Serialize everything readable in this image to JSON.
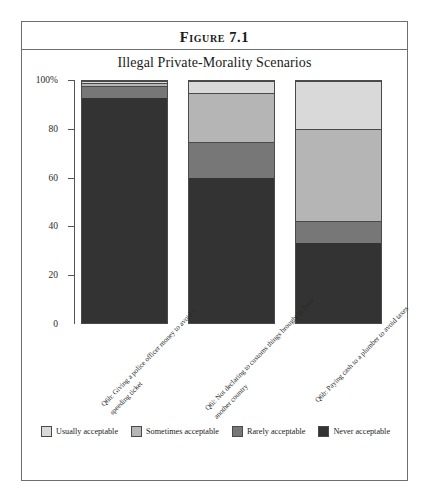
{
  "figure": {
    "title": "Figure 7.1",
    "subtitle": "Illegal Private-Morality Scenarios"
  },
  "chart_data": {
    "type": "bar",
    "subtype": "stacked-percentage-column",
    "title": "Illegal Private-Morality Scenarios",
    "figure_label": "Figure 7.1",
    "xlabel": "",
    "ylabel": "",
    "ylim": [
      0,
      100
    ],
    "ytick_labels": [
      "0",
      "20",
      "40",
      "60",
      "80",
      "100%"
    ],
    "yticks": [
      0,
      20,
      40,
      60,
      80,
      100
    ],
    "grid": false,
    "legend_position": "bottom",
    "categories": [
      "Q6h: Giving a police officer money to avoid a speeding ticket",
      "Q6i: Not declaring to customs things brought in from another country",
      "Q6b: Paying cash to a plumber to avoid taxes"
    ],
    "series": [
      {
        "name": "Usually acceptable",
        "color": "#d9d9d9",
        "values": [
          1,
          5,
          20
        ]
      },
      {
        "name": "Sometimes acceptable",
        "color": "#b5b5b5",
        "values": [
          1,
          20,
          38
        ]
      },
      {
        "name": "Rarely acceptable",
        "color": "#777777",
        "values": [
          5,
          15,
          9
        ]
      },
      {
        "name": "Never acceptable",
        "color": "#333333",
        "values": [
          93,
          60,
          33
        ]
      }
    ]
  },
  "legend": {
    "items": [
      {
        "label": "Usually acceptable",
        "color": "#d9d9d9"
      },
      {
        "label": "Sometimes acceptable",
        "color": "#b5b5b5"
      },
      {
        "label": "Rarely acceptable",
        "color": "#777777"
      },
      {
        "label": "Never acceptable",
        "color": "#333333"
      }
    ]
  }
}
